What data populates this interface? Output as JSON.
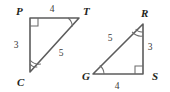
{
  "figure": {
    "kind": "geometry-diagram",
    "stroke_color": "#5c5c5c",
    "mark_color": "#6b6b6b",
    "label_color": "#231f20",
    "background": "#ffffff"
  },
  "triangles": [
    {
      "id": "left",
      "name": "triangle-PTC",
      "vertices": [
        {
          "key": "P",
          "label": "P",
          "x": 30,
          "y": 18,
          "label_x": 16,
          "label_y": 15,
          "mark": "right-angle"
        },
        {
          "key": "T",
          "label": "T",
          "x": 79,
          "y": 18,
          "label_x": 83,
          "label_y": 15,
          "mark": "single-arc"
        },
        {
          "key": "C",
          "label": "C",
          "x": 30,
          "y": 72,
          "label_x": 17,
          "label_y": 86,
          "mark": "double-arc"
        }
      ],
      "sides": [
        {
          "key": "PT",
          "label": "4",
          "label_x": 52,
          "label_y": 12
        },
        {
          "key": "PC",
          "label": "3",
          "label_x": 16,
          "label_y": 48
        },
        {
          "key": "CT",
          "label": "5",
          "label_x": 61,
          "label_y": 56
        }
      ]
    },
    {
      "id": "right",
      "name": "triangle-RGS",
      "vertices": [
        {
          "key": "R",
          "label": "R",
          "x": 143,
          "y": 24,
          "label_x": 141,
          "label_y": 17,
          "mark": "double-arc"
        },
        {
          "key": "G",
          "label": "G",
          "x": 93,
          "y": 74,
          "label_x": 82,
          "label_y": 80,
          "mark": "single-arc"
        },
        {
          "key": "S",
          "label": "S",
          "x": 143,
          "y": 74,
          "label_x": 152,
          "label_y": 80,
          "mark": "right-angle"
        }
      ],
      "sides": [
        {
          "key": "GR",
          "label": "5",
          "label_x": 110,
          "label_y": 41
        },
        {
          "key": "RS",
          "label": "3",
          "label_x": 150,
          "label_y": 50
        },
        {
          "key": "GS",
          "label": "4",
          "label_x": 117,
          "label_y": 89
        }
      ]
    }
  ]
}
